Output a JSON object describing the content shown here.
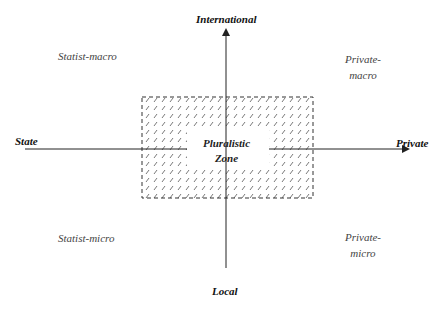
{
  "axes": {
    "top": "International",
    "bottom": "Local",
    "left": "State",
    "right": "Private"
  },
  "quadrants": {
    "top_left": "Statist-macro",
    "top_right_line1": "Private-",
    "top_right_line2": "macro",
    "bottom_left": "Statist-micro",
    "bottom_right_line1": "Private-",
    "bottom_right_line2": "micro"
  },
  "center_zone": {
    "line1": "Pluralistic",
    "line2": "Zone"
  },
  "colors": {
    "line": "#222222",
    "hatch": "#555555"
  }
}
